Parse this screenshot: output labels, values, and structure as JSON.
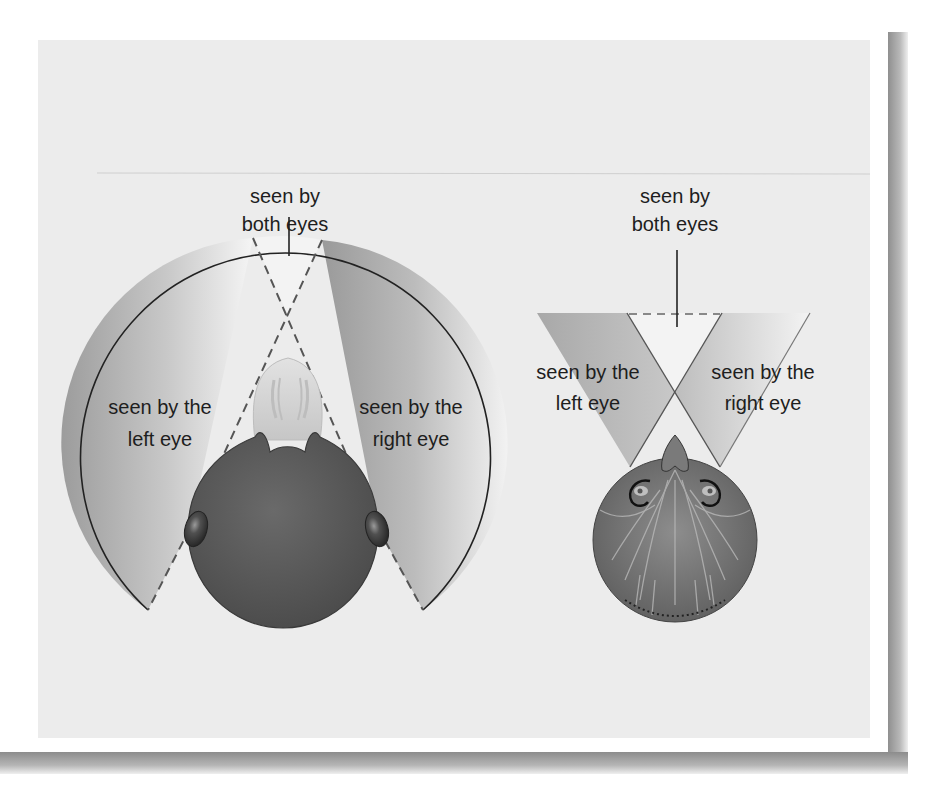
{
  "figure": {
    "left_diagram": {
      "subject": "duck head (top view), eyes on sides of head",
      "label_top_line1": "seen by",
      "label_top_line2": "both eyes",
      "label_left_line1": "seen by the",
      "label_left_line2": "left eye",
      "label_right_line1": "seen by the",
      "label_right_line2": "right eye"
    },
    "right_diagram": {
      "subject": "owl head (top view), forward-facing eyes",
      "label_top_line1": "seen by",
      "label_top_line2": "both eyes",
      "label_left_line1": "seen by the",
      "label_left_line2": "left eye",
      "label_right_line1": "seen by the",
      "label_right_line2": "right eye"
    },
    "colors": {
      "panel_background": "#ececec",
      "field_dark": "#9a9a9a",
      "field_light": "#f4f4f4",
      "head_dark": "#5a5a5a",
      "outline": "#222222"
    }
  }
}
